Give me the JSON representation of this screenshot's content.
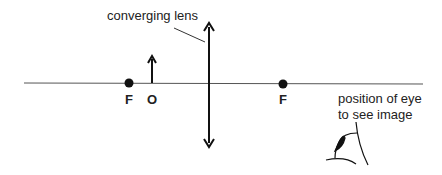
{
  "diagram": {
    "lens_label": "converging lens",
    "focal_left_label": "F",
    "object_label": "O",
    "focal_right_label": "F",
    "eye_label_line1": "position of eye",
    "eye_label_line2": "to see image"
  }
}
